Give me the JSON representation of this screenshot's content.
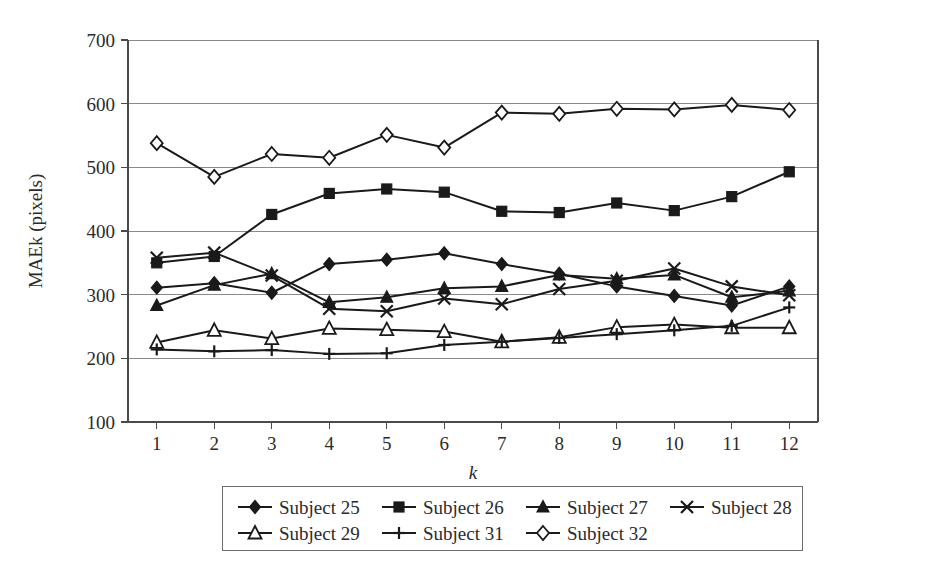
{
  "chart_data": {
    "type": "line",
    "title": "",
    "xlabel": "k",
    "ylabel": "MAEk (pixels)",
    "x": [
      1,
      2,
      3,
      4,
      5,
      6,
      7,
      8,
      9,
      10,
      11,
      12
    ],
    "xtick_labels": [
      "1",
      "2",
      "3",
      "4",
      "5",
      "6",
      "7",
      "8",
      "9",
      "10",
      "11",
      "12"
    ],
    "ytick_labels": [
      "100",
      "200",
      "300",
      "400",
      "500",
      "600",
      "700"
    ],
    "yticks": [
      100,
      200,
      300,
      400,
      500,
      600,
      700
    ],
    "ylim": [
      100,
      700
    ],
    "xlim": [
      0.5,
      12.5
    ],
    "grid": "horizontal",
    "legend_position": "bottom",
    "series": [
      {
        "name": "Subject 25",
        "marker": "filled-diamond",
        "values": [
          311,
          318,
          303,
          348,
          355,
          365,
          348,
          333,
          313,
          298,
          283,
          313
        ]
      },
      {
        "name": "Subject 26",
        "marker": "filled-square",
        "values": [
          350,
          360,
          426,
          459,
          466,
          461,
          431,
          429,
          444,
          432,
          454,
          493
        ]
      },
      {
        "name": "Subject 27",
        "marker": "filled-triangle",
        "values": [
          283,
          315,
          333,
          288,
          296,
          310,
          313,
          331,
          325,
          331,
          296,
          306
        ]
      },
      {
        "name": "Subject 28",
        "marker": "cross-x",
        "values": [
          358,
          366,
          330,
          278,
          274,
          294,
          285,
          309,
          322,
          341,
          313,
          299
        ]
      },
      {
        "name": "Subject 29",
        "marker": "open-triangle",
        "values": [
          225,
          244,
          231,
          247,
          245,
          242,
          226,
          233,
          249,
          253,
          248,
          248
        ]
      },
      {
        "name": "Subject 31",
        "marker": "plus",
        "values": [
          214,
          211,
          213,
          207,
          208,
          221,
          226,
          232,
          238,
          244,
          251,
          280
        ]
      },
      {
        "name": "Subject 32",
        "marker": "open-diamond",
        "values": [
          538,
          485,
          521,
          515,
          551,
          531,
          586,
          584,
          592,
          591,
          598,
          590
        ]
      }
    ]
  },
  "legend": {
    "rows": [
      [
        "Subject 25",
        "Subject 26",
        "Subject 27",
        "Subject 28"
      ],
      [
        "Subject 29",
        "Subject 31",
        "Subject 32"
      ]
    ]
  },
  "colors": {
    "ink": "#1a1a1a",
    "grid": "#8a8a8a",
    "axis": "#4a4a4a",
    "background": "#ffffff"
  }
}
